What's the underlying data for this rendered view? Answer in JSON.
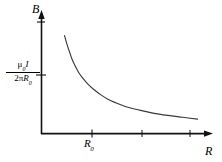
{
  "figure": {
    "name": "magnetic-field-vs-radius-graph",
    "background_color": "#ffffff",
    "line_color": "#000000",
    "axis_color": "#000000"
  },
  "axes": {
    "y_label": "B",
    "x_label": "R",
    "origin_label": ""
  },
  "y_value_label": {
    "numerator_mu": "μ",
    "numerator_mu_sub": "0",
    "numerator_current": "I",
    "denominator_two": "2",
    "denominator_pi": "π",
    "denominator_r": "R",
    "denominator_r_sub": "0",
    "plain_text": "μ0I / 2πR0"
  },
  "x_tick_labels": {
    "r0_main": "R",
    "r0_sub": "0",
    "plain_text": "R0"
  },
  "chart_data": {
    "type": "line",
    "title": "",
    "xlabel": "R",
    "ylabel": "B",
    "grid": false,
    "legend": null,
    "xlim": [
      0,
      4.4
    ],
    "ylim": [
      0,
      2.5
    ],
    "annotations": [
      {
        "text": "μ0I / 2πR0",
        "axis": "y",
        "value": 1.0
      },
      {
        "text": "R0",
        "axis": "x",
        "value": 1.0
      }
    ],
    "x_ticks": [
      1.0,
      2.33,
      3.5
    ],
    "x_tick_text": [
      "R0",
      "",
      ""
    ],
    "y_ticks": [
      1.0,
      2.1
    ],
    "y_tick_text": [
      "μ0I / 2πR0",
      ""
    ],
    "series": [
      {
        "name": "B = μ0 I / (2πR)",
        "x": [
          0.62,
          0.68,
          0.75,
          0.82,
          0.9,
          1.0,
          1.1,
          1.25,
          1.4,
          1.6,
          1.8,
          2.0,
          2.3,
          2.6,
          3.0,
          3.4,
          3.8,
          4.2
        ],
        "y": [
          2.1,
          1.93,
          1.76,
          1.6,
          1.46,
          1.31,
          1.2,
          1.06,
          0.95,
          0.83,
          0.73,
          0.66,
          0.57,
          0.51,
          0.44,
          0.39,
          0.35,
          0.31
        ]
      }
    ]
  }
}
